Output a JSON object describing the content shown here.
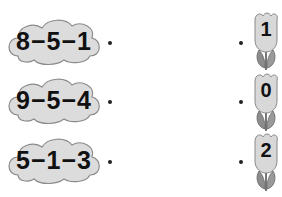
{
  "exercise": {
    "expressions": [
      {
        "text": "8−5−1"
      },
      {
        "text": "9−5−4"
      },
      {
        "text": "5−1−3"
      }
    ],
    "answers": [
      {
        "text": "1"
      },
      {
        "text": "0"
      },
      {
        "text": "2"
      }
    ],
    "colors": {
      "cloud_fill": "#dcdcdc",
      "cloud_outline": "#8a8a8a",
      "tulip_fill": "#d8d8d8",
      "leaf_fill": "#8c8c8c"
    }
  }
}
